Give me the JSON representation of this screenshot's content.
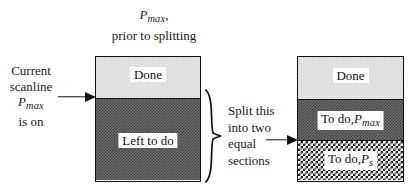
{
  "figure": {
    "title_annotation": {
      "symbol": "P",
      "subscript": "max",
      "comma": ",",
      "line2": "prior to splitting"
    },
    "left_annotation": {
      "line1": "Current",
      "line2": "scanline",
      "symbol": "P",
      "subscript": "max",
      "line4": "is on"
    },
    "middle_annotation": {
      "line1": "Split this",
      "line2": "into two",
      "line3": "equal",
      "line4": "sections"
    },
    "left_box": {
      "name": "before-splitting-box",
      "sections": [
        {
          "label": "Done",
          "fill": "light"
        },
        {
          "label": "Left to do",
          "fill": "dark"
        }
      ]
    },
    "right_box": {
      "name": "after-splitting-box",
      "sections": [
        {
          "label": "Done",
          "fill": "light"
        },
        {
          "label": "To do,",
          "symbol": "P",
          "subscript": "max",
          "fill": "dark"
        },
        {
          "label": "To do,",
          "symbol": "P",
          "subscript": "s",
          "fill": "check"
        }
      ]
    },
    "colors": {
      "stroke": "#111111",
      "light_fill": "#e9e9e9",
      "dark_fill": "#6e6e6e",
      "check_fill": "#ffffff",
      "background": "#ffffff",
      "text": "#101010"
    }
  }
}
